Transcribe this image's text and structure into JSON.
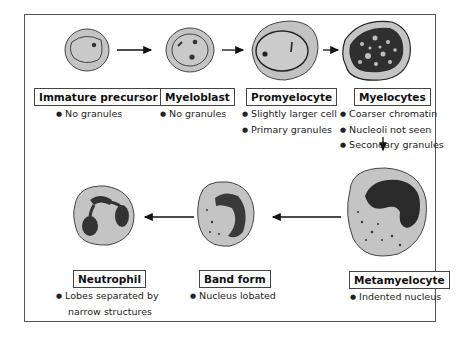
{
  "diagram": {
    "stages": [
      {
        "name": "Immature precursor",
        "notes": [
          "No granules"
        ]
      },
      {
        "name": "Myeloblast",
        "notes": [
          "No granules"
        ]
      },
      {
        "name": "Promyelocyte",
        "notes": [
          "Slightly larger cell",
          "Primary granules"
        ]
      },
      {
        "name": "Myelocytes",
        "notes": [
          "Coarser chromatin",
          "Nucleoli not seen",
          "Secondary granules"
        ]
      },
      {
        "name": "Metamyelocyte",
        "notes": [
          "Indented nucleus"
        ]
      },
      {
        "name": "Band form",
        "notes": [
          "Nucleus lobated"
        ]
      },
      {
        "name": "Neutrophil",
        "notes": [
          "Lobes separated by",
          "narrow structures"
        ]
      }
    ],
    "colors": {
      "cytoplasm": "#c8c8c8",
      "nucleus": "#2a2a2a",
      "outline": "#333333"
    }
  }
}
